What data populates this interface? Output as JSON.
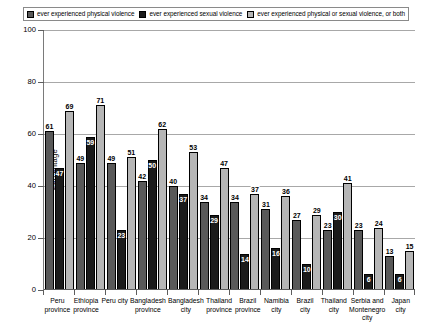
{
  "chart_data": {
    "type": "bar",
    "title": "",
    "xlabel": "",
    "ylabel": "Percentage",
    "ylim": [
      0,
      100
    ],
    "yticks": [
      0,
      20,
      40,
      60,
      80,
      100
    ],
    "grid": true,
    "legend_position": "top",
    "categories": [
      "Peru province",
      "Ethiopia province",
      "Peru city",
      "Bangladesh province",
      "Bangladesh city",
      "Thailand province",
      "Brazil province",
      "Namibia city",
      "Brazil city",
      "Thailand city",
      "Serbia and Montenegro city",
      "Japan city"
    ],
    "category_lines": [
      [
        "Peru",
        "province"
      ],
      [
        "Ethiopia",
        "province"
      ],
      [
        "Peru city"
      ],
      [
        "Bangladesh",
        "province"
      ],
      [
        "Bangladesh",
        "city"
      ],
      [
        "Thailand",
        "province"
      ],
      [
        "Brazil",
        "province"
      ],
      [
        "Namibia",
        "city"
      ],
      [
        "Brazil",
        "city"
      ],
      [
        "Thailand",
        "city"
      ],
      [
        "Serbia and",
        "Montenegro",
        "city"
      ],
      [
        "Japan city"
      ]
    ],
    "series": [
      {
        "name": "ever experienced physical violence",
        "color": "#595959",
        "values": [
          61,
          49,
          49,
          42,
          40,
          34,
          34,
          31,
          27,
          23,
          23,
          13
        ]
      },
      {
        "name": "ever experienced sexual violence",
        "color": "#1b1b1b",
        "values": [
          47,
          59,
          23,
          50,
          37,
          29,
          14,
          16,
          10,
          30,
          6,
          6
        ]
      },
      {
        "name": "ever experienced physical or sexual violence, or both",
        "color": "#b6b6b6",
        "values": [
          69,
          71,
          51,
          62,
          53,
          47,
          37,
          36,
          29,
          41,
          24,
          15
        ]
      }
    ]
  },
  "legend": {
    "items": [
      {
        "label": "ever experienced physical violence",
        "swatch": "#595959"
      },
      {
        "label": "ever experienced sexual violence",
        "swatch": "#1b1b1b"
      },
      {
        "label": "ever experienced physical or sexual violence, or both",
        "swatch": "#b6b6b6"
      }
    ]
  },
  "axis": {
    "y_title": "Percentage",
    "y_tick_labels": [
      "0",
      "20",
      "40",
      "60",
      "80",
      "100"
    ]
  }
}
